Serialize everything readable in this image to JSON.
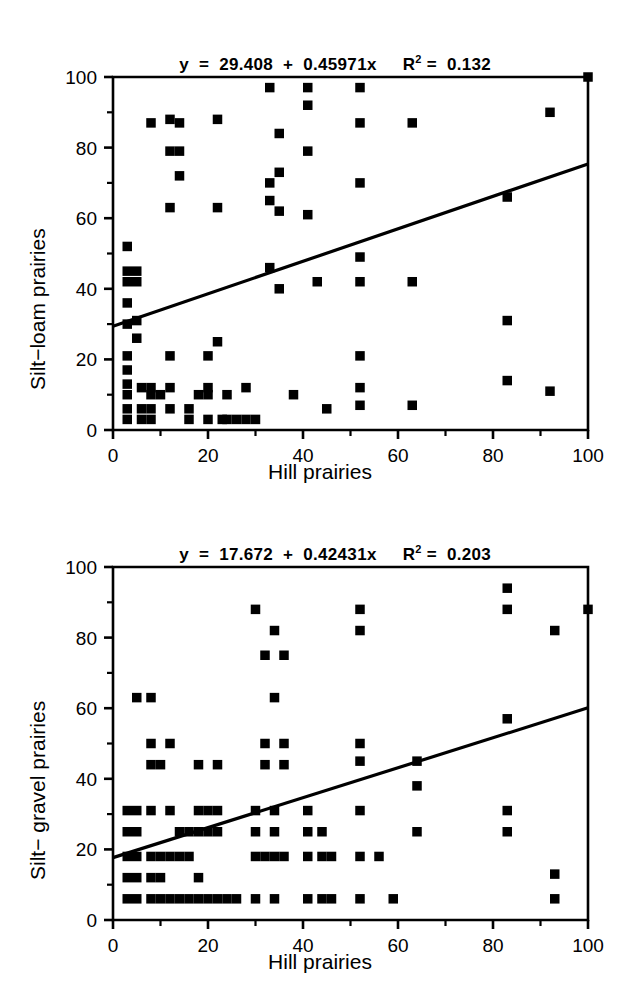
{
  "figure": {
    "background": "#ffffff",
    "ink": "#000000"
  },
  "panels": [
    {
      "id": "top",
      "equation": {
        "lhs": "y",
        "text": "y  =  29.408  +  0.45971x",
        "r2_label": "R",
        "r2_exponent": "2",
        "r2_value": "=  0.132"
      },
      "ylabel": "Silt−loam prairies",
      "xlabel": "Hill prairies"
    },
    {
      "id": "bottom",
      "equation": {
        "lhs": "y",
        "text": "y  =  17.672  +  0.42431x",
        "r2_label": "R",
        "r2_exponent": "2",
        "r2_value": "=  0.203"
      },
      "ylabel": "Silt− gravel prairies",
      "xlabel": "Hill prairies"
    }
  ],
  "chart_data": [
    {
      "type": "scatter",
      "title": "y = 29.408 + 0.45971x    R^2 = 0.132",
      "xlabel": "Hill prairies",
      "ylabel": "Silt-loam prairies",
      "xlim": [
        0,
        100
      ],
      "ylim": [
        0,
        100
      ],
      "xticks": [
        0,
        20,
        40,
        60,
        80,
        100
      ],
      "yticks": [
        0,
        20,
        40,
        60,
        80,
        100
      ],
      "xminor_ticks": [
        10,
        30,
        50,
        70,
        90
      ],
      "yminor_ticks": [
        10,
        30,
        50,
        70,
        90
      ],
      "grid": false,
      "legend": "none",
      "marker": "square",
      "marker_color": "#000000",
      "fit_line": {
        "intercept": 29.408,
        "slope": 0.45971,
        "r2": 0.132,
        "x_start": 0,
        "x_end": 100,
        "y_start": 29.408,
        "y_end": 75.379
      },
      "points": [
        [
          3,
          52
        ],
        [
          3,
          45
        ],
        [
          3,
          42
        ],
        [
          3,
          36
        ],
        [
          3,
          30
        ],
        [
          3,
          21
        ],
        [
          3,
          17
        ],
        [
          3,
          13
        ],
        [
          3,
          10
        ],
        [
          3,
          6
        ],
        [
          3,
          3
        ],
        [
          5,
          45
        ],
        [
          5,
          42
        ],
        [
          5,
          31
        ],
        [
          5,
          26
        ],
        [
          6,
          12
        ],
        [
          6,
          6
        ],
        [
          6,
          3
        ],
        [
          8,
          87
        ],
        [
          8,
          12
        ],
        [
          8,
          10
        ],
        [
          8,
          6
        ],
        [
          8,
          3
        ],
        [
          10,
          10
        ],
        [
          12,
          88
        ],
        [
          12,
          79
        ],
        [
          12,
          63
        ],
        [
          12,
          21
        ],
        [
          12,
          12
        ],
        [
          12,
          6
        ],
        [
          14,
          87
        ],
        [
          14,
          79
        ],
        [
          14,
          72
        ],
        [
          16,
          6
        ],
        [
          16,
          3
        ],
        [
          18,
          10
        ],
        [
          20,
          21
        ],
        [
          20,
          12
        ],
        [
          20,
          10
        ],
        [
          20,
          3
        ],
        [
          22,
          88
        ],
        [
          22,
          63
        ],
        [
          22,
          25
        ],
        [
          23,
          3
        ],
        [
          24,
          10
        ],
        [
          24,
          3
        ],
        [
          26,
          3
        ],
        [
          28,
          12
        ],
        [
          28,
          3
        ],
        [
          30,
          3
        ],
        [
          33,
          97
        ],
        [
          33,
          70
        ],
        [
          33,
          65
        ],
        [
          33,
          46
        ],
        [
          35,
          84
        ],
        [
          35,
          73
        ],
        [
          35,
          62
        ],
        [
          35,
          40
        ],
        [
          38,
          10
        ],
        [
          41,
          92
        ],
        [
          41,
          97
        ],
        [
          41,
          79
        ],
        [
          41,
          61
        ],
        [
          43,
          42
        ],
        [
          45,
          6
        ],
        [
          52,
          97
        ],
        [
          52,
          87
        ],
        [
          52,
          70
        ],
        [
          52,
          49
        ],
        [
          52,
          42
        ],
        [
          52,
          21
        ],
        [
          52,
          12
        ],
        [
          52,
          7
        ],
        [
          63,
          87
        ],
        [
          63,
          42
        ],
        [
          63,
          7
        ],
        [
          83,
          66
        ],
        [
          83,
          31
        ],
        [
          83,
          14
        ],
        [
          92,
          90
        ],
        [
          92,
          11
        ],
        [
          100,
          100
        ]
      ]
    },
    {
      "type": "scatter",
      "title": "y = 17.672 + 0.42431x    R^2 = 0.203",
      "xlabel": "Hill prairies",
      "ylabel": "Silt-gravel prairies",
      "xlim": [
        0,
        100
      ],
      "ylim": [
        0,
        100
      ],
      "xticks": [
        0,
        20,
        40,
        60,
        80,
        100
      ],
      "yticks": [
        0,
        20,
        40,
        60,
        80,
        100
      ],
      "xminor_ticks": [
        10,
        30,
        50,
        70,
        90
      ],
      "yminor_ticks": [
        10,
        30,
        50,
        70,
        90
      ],
      "grid": false,
      "legend": "none",
      "marker": "square",
      "marker_color": "#000000",
      "fit_line": {
        "intercept": 17.672,
        "slope": 0.42431,
        "r2": 0.203,
        "x_start": 0,
        "x_end": 100,
        "y_start": 17.672,
        "y_end": 60.103
      },
      "points": [
        [
          3,
          31
        ],
        [
          3,
          25
        ],
        [
          3,
          18
        ],
        [
          3,
          12
        ],
        [
          3,
          6
        ],
        [
          5,
          63
        ],
        [
          5,
          31
        ],
        [
          5,
          25
        ],
        [
          5,
          18
        ],
        [
          5,
          12
        ],
        [
          5,
          6
        ],
        [
          8,
          63
        ],
        [
          8,
          50
        ],
        [
          8,
          44
        ],
        [
          8,
          31
        ],
        [
          8,
          18
        ],
        [
          8,
          12
        ],
        [
          8,
          6
        ],
        [
          10,
          44
        ],
        [
          10,
          18
        ],
        [
          10,
          12
        ],
        [
          10,
          6
        ],
        [
          12,
          50
        ],
        [
          12,
          31
        ],
        [
          12,
          18
        ],
        [
          12,
          6
        ],
        [
          14,
          25
        ],
        [
          14,
          18
        ],
        [
          14,
          6
        ],
        [
          16,
          25
        ],
        [
          16,
          18
        ],
        [
          16,
          6
        ],
        [
          18,
          44
        ],
        [
          18,
          31
        ],
        [
          18,
          25
        ],
        [
          18,
          12
        ],
        [
          18,
          6
        ],
        [
          20,
          31
        ],
        [
          20,
          25
        ],
        [
          20,
          6
        ],
        [
          22,
          44
        ],
        [
          22,
          31
        ],
        [
          22,
          25
        ],
        [
          22,
          6
        ],
        [
          24,
          6
        ],
        [
          26,
          6
        ],
        [
          30,
          88
        ],
        [
          30,
          31
        ],
        [
          30,
          25
        ],
        [
          30,
          18
        ],
        [
          30,
          6
        ],
        [
          32,
          75
        ],
        [
          32,
          50
        ],
        [
          32,
          44
        ],
        [
          32,
          18
        ],
        [
          34,
          82
        ],
        [
          34,
          63
        ],
        [
          34,
          31
        ],
        [
          34,
          25
        ],
        [
          34,
          18
        ],
        [
          34,
          6
        ],
        [
          36,
          75
        ],
        [
          36,
          50
        ],
        [
          36,
          44
        ],
        [
          36,
          18
        ],
        [
          41,
          31
        ],
        [
          41,
          25
        ],
        [
          41,
          18
        ],
        [
          41,
          6
        ],
        [
          44,
          25
        ],
        [
          44,
          18
        ],
        [
          44,
          6
        ],
        [
          46,
          18
        ],
        [
          46,
          6
        ],
        [
          52,
          88
        ],
        [
          52,
          82
        ],
        [
          52,
          50
        ],
        [
          52,
          45
        ],
        [
          52,
          31
        ],
        [
          52,
          18
        ],
        [
          52,
          6
        ],
        [
          56,
          18
        ],
        [
          59,
          6
        ],
        [
          64,
          45
        ],
        [
          64,
          38
        ],
        [
          64,
          25
        ],
        [
          83,
          94
        ],
        [
          83,
          88
        ],
        [
          83,
          57
        ],
        [
          83,
          31
        ],
        [
          83,
          25
        ],
        [
          93,
          82
        ],
        [
          93,
          13
        ],
        [
          93,
          6
        ],
        [
          100,
          88
        ]
      ]
    }
  ]
}
